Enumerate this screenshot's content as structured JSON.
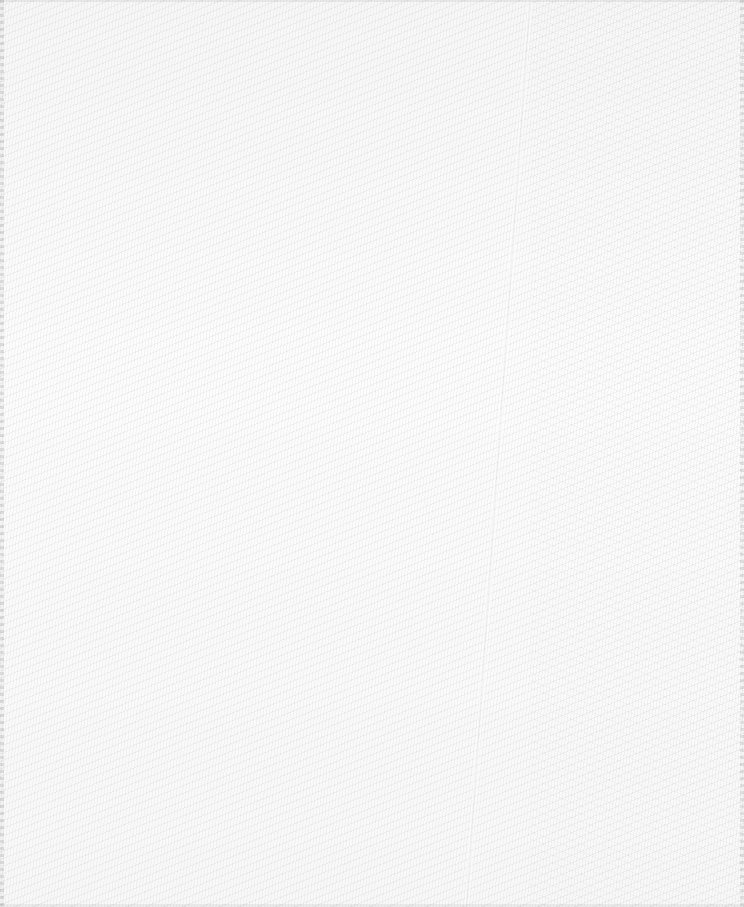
{
  "image": {
    "subject": "white woven fabric texture",
    "weave": "twill / herringbone",
    "colors": {
      "base": "#fcfcfc",
      "thread_shadow": "#e6e6e6",
      "edge": "#d8d8d8"
    }
  }
}
